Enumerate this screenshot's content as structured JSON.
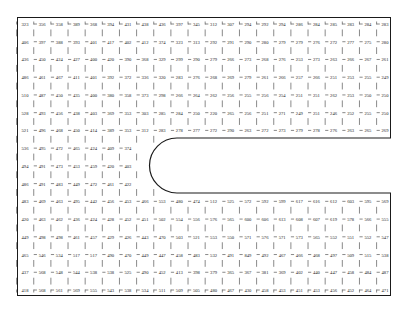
{
  "figure": {
    "type": "nodal-value-mesh",
    "title": "",
    "border_color": "#1a1a1a",
    "text_color": "#1c1c1c",
    "background": "#ffffff",
    "rows": 16,
    "cols": 22,
    "cutout": {
      "name": "rounded-rectangle-void",
      "shape": "rounded-left-capsule",
      "x": 150,
      "y": 138,
      "width": 241,
      "height": 55,
      "corner_radius": 27
    }
  },
  "chart_data": {
    "type": "heatmap",
    "title": "",
    "xlabel": "",
    "ylabel": "",
    "grid": true,
    "legend": "none",
    "rows": 16,
    "cols": 22,
    "void_rows": [
      7,
      8,
      9
    ],
    "void_start_col": 7,
    "values": [
      [
        323,
        356,
        358,
        389,
        368,
        394,
        431,
        438,
        436,
        397,
        345,
        312,
        307,
        294,
        292,
        294,
        286,
        284,
        285,
        283,
        284,
        283
      ],
      [
        406,
        397,
        388,
        393,
        401,
        417,
        402,
        412,
        374,
        323,
        313,
        292,
        291,
        290,
        280,
        279,
        279,
        276,
        272,
        277,
        275,
        280
      ],
      [
        436,
        450,
        424,
        427,
        400,
        420,
        390,
        368,
        329,
        299,
        290,
        279,
        266,
        273,
        268,
        276,
        253,
        273,
        263,
        266,
        267,
        261
      ],
      [
        486,
        461,
        467,
        411,
        401,
        392,
        372,
        336,
        320,
        283,
        276,
        268,
        269,
        279,
        261,
        266,
        257,
        266,
        251,
        253,
        255,
        249
      ],
      [
        510,
        487,
        450,
        435,
        400,
        380,
        358,
        373,
        298,
        266,
        264,
        262,
        256,
        255,
        256,
        254,
        251,
        251,
        262,
        253,
        250,
        250
      ],
      [
        528,
        493,
        456,
        438,
        403,
        369,
        353,
        303,
        285,
        284,
        250,
        220,
        265,
        256,
        251,
        271,
        249,
        251,
        246,
        252,
        255,
        250
      ],
      [
        521,
        496,
        468,
        450,
        414,
        389,
        353,
        312,
        283,
        278,
        277,
        272,
        290,
        263,
        272,
        273,
        279,
        278,
        276,
        263,
        265,
        269
      ],
      [
        536,
        495,
        472,
        465,
        424,
        409,
        374,
        null,
        null,
        null,
        null,
        null,
        null,
        null,
        null,
        null,
        null,
        null,
        null,
        null,
        null,
        null
      ],
      [
        494,
        491,
        473,
        453,
        459,
        420,
        403,
        null,
        null,
        null,
        null,
        null,
        null,
        null,
        null,
        null,
        null,
        null,
        null,
        null,
        null,
        null
      ],
      [
        486,
        491,
        483,
        449,
        472,
        461,
        422,
        null,
        null,
        null,
        null,
        null,
        null,
        null,
        null,
        null,
        null,
        null,
        null,
        null,
        null,
        null
      ],
      [
        483,
        469,
        463,
        495,
        442,
        456,
        453,
        466,
        553,
        480,
        474,
        512,
        525,
        572,
        592,
        599,
        617,
        616,
        612,
        603,
        595,
        569
      ],
      [
        420,
        463,
        462,
        436,
        424,
        428,
        452,
        451,
        502,
        554,
        556,
        576,
        565,
        600,
        606,
        613,
        608,
        607,
        619,
        578,
        566,
        555
      ],
      [
        449,
        498,
        498,
        461,
        457,
        429,
        426,
        443,
        470,
        503,
        521,
        553,
        550,
        571,
        576,
        571,
        573,
        565,
        552,
        551,
        552,
        547
      ],
      [
        465,
        546,
        534,
        517,
        517,
        490,
        470,
        449,
        447,
        458,
        483,
        532,
        491,
        849,
        492,
        467,
        466,
        468,
        497,
        509,
        515,
        538
      ],
      [
        437,
        568,
        548,
        544,
        538,
        538,
        525,
        490,
        452,
        413,
        398,
        379,
        365,
        367,
        381,
        369,
        402,
        440,
        447,
        458,
        484,
        487
      ],
      [
        418,
        568,
        561,
        569,
        555,
        543,
        538,
        534,
        511,
        509,
        505,
        480,
        467,
        430,
        458,
        453,
        451,
        453,
        456,
        452,
        464,
        471
      ],
      [
        525,
        670,
        673,
        657,
        674,
        657,
        655,
        651,
        650,
        636,
        622,
        629,
        603,
        565,
        569,
        574,
        552,
        558,
        547,
        538,
        546,
        531
      ]
    ]
  }
}
